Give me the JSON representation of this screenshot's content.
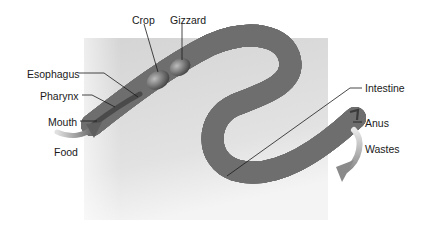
{
  "diagram": {
    "title": "",
    "background_box": {
      "x": 84,
      "y": 38,
      "w": 244,
      "h": 182,
      "color": "#d6d6d6"
    },
    "labels": [
      {
        "id": "crop",
        "text": "Crop",
        "x": 132,
        "y": 14
      },
      {
        "id": "gizzard",
        "text": "Gizzard",
        "x": 170,
        "y": 14
      },
      {
        "id": "esophagus",
        "text": "Esophagus",
        "x": 27,
        "y": 68
      },
      {
        "id": "pharynx",
        "text": "Pharynx",
        "x": 40,
        "y": 90
      },
      {
        "id": "mouth",
        "text": "Mouth",
        "x": 48,
        "y": 116
      },
      {
        "id": "food",
        "text": "Food",
        "x": 54,
        "y": 146
      },
      {
        "id": "intestine",
        "text": "Intestine",
        "x": 365,
        "y": 82
      },
      {
        "id": "anus",
        "text": "Anus",
        "x": 365,
        "y": 117
      },
      {
        "id": "wastes",
        "text": "Wastes",
        "x": 365,
        "y": 143
      }
    ]
  }
}
